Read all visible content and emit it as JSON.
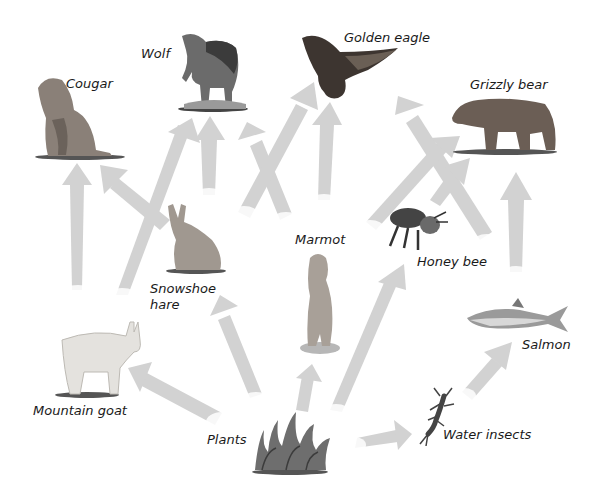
{
  "diagram": {
    "type": "food-web",
    "arrow_color": "#d2d2d2",
    "label_color": "#1a1a1a",
    "organisms": [
      {
        "id": "cougar",
        "label": "Cougar",
        "x": 65,
        "y": 72
      },
      {
        "id": "wolf",
        "label": "Wolf",
        "x": 140,
        "y": 44
      },
      {
        "id": "golden_eagle",
        "label": "Golden eagle",
        "x": 344,
        "y": 30
      },
      {
        "id": "grizzly_bear",
        "label": "Grizzly bear",
        "x": 472,
        "y": 77
      },
      {
        "id": "snowshoe_hare",
        "label": "Snowshoe hare",
        "x": 150,
        "y": 283
      },
      {
        "id": "marmot",
        "label": "Marmot",
        "x": 295,
        "y": 232
      },
      {
        "id": "honey_bee",
        "label": "Honey bee",
        "x": 416,
        "y": 253
      },
      {
        "id": "salmon",
        "label": "Salmon",
        "x": 522,
        "y": 337
      },
      {
        "id": "mountain_goat",
        "label": "Mountain goat",
        "x": 33,
        "y": 403
      },
      {
        "id": "water_insects",
        "label": "Water insects",
        "x": 443,
        "y": 427
      },
      {
        "id": "plants",
        "label": "Plants",
        "x": 207,
        "y": 432
      }
    ],
    "arrows": [
      {
        "from": "plants",
        "to": "mountain_goat"
      },
      {
        "from": "plants",
        "to": "snowshoe_hare"
      },
      {
        "from": "plants",
        "to": "marmot"
      },
      {
        "from": "plants",
        "to": "honey_bee"
      },
      {
        "from": "plants",
        "to": "water_insects"
      },
      {
        "from": "water_insects",
        "to": "salmon"
      },
      {
        "from": "salmon",
        "to": "grizzly_bear"
      },
      {
        "from": "mountain_goat",
        "to": "cougar"
      },
      {
        "from": "mountain_goat",
        "to": "wolf"
      },
      {
        "from": "snowshoe_hare",
        "to": "cougar"
      },
      {
        "from": "snowshoe_hare",
        "to": "wolf"
      },
      {
        "from": "snowshoe_hare",
        "to": "golden_eagle"
      },
      {
        "from": "marmot",
        "to": "wolf"
      },
      {
        "from": "marmot",
        "to": "golden_eagle"
      },
      {
        "from": "marmot",
        "to": "grizzly_bear"
      },
      {
        "from": "honey_bee",
        "to": "golden_eagle"
      },
      {
        "from": "honey_bee",
        "to": "grizzly_bear"
      }
    ]
  }
}
